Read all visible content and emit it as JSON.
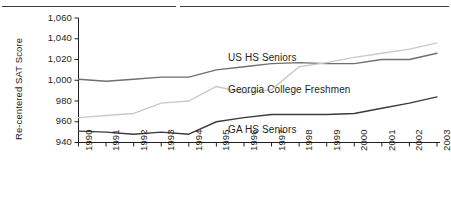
{
  "figure": {
    "caption_fragment": "",
    "ylabel": "Re-centered SAT Score"
  },
  "chart_data": {
    "type": "line",
    "title": "",
    "xlabel": "",
    "ylabel": "Re-centered SAT Score",
    "xlim": [
      1990,
      2003
    ],
    "ylim": [
      940,
      1060
    ],
    "yticks": [
      "940",
      "960",
      "980",
      "1,000",
      "1,020",
      "1,040",
      "1,060"
    ],
    "ytick_values": [
      940,
      960,
      980,
      1000,
      1020,
      1040,
      1060
    ],
    "grid": false,
    "legend": "inline-labels",
    "categories": [
      1990,
      1991,
      1992,
      1993,
      1994,
      1995,
      1996,
      1997,
      1998,
      1999,
      2000,
      2001,
      2002,
      2003
    ],
    "xtick_labels": [
      "1990",
      "1991",
      "1992",
      "1993",
      "1994",
      "1995",
      "1996",
      "1997",
      "1998",
      "1999",
      "2000",
      "2001",
      "2002",
      "2003"
    ],
    "series": [
      {
        "name": "US HS Seniors",
        "color": "#6f6f6f",
        "values": [
          1001,
          999,
          1001,
          1003,
          1003,
          1010,
          1013,
          1016,
          1017,
          1016,
          1016,
          1020,
          1020,
          1026
        ]
      },
      {
        "name": "Georgia College Freshmen",
        "color": "#c9c9c9",
        "values": [
          964,
          966,
          968,
          978,
          980,
          994,
          988,
          991,
          1013,
          1017,
          1022,
          1026,
          1030,
          1036
        ]
      },
      {
        "name": "GA HS Seniors",
        "color": "#3a3a3a",
        "values": [
          951,
          950,
          948,
          950,
          948,
          960,
          964,
          967,
          967,
          967,
          968,
          973,
          978,
          984
        ]
      }
    ]
  },
  "series_labels": [
    {
      "text": "US HS Seniors",
      "x": 228,
      "y": 52
    },
    {
      "text": "Georgia College Freshmen",
      "x": 228,
      "y": 84
    },
    {
      "text": "GA HS Seniors",
      "x": 228,
      "y": 124
    }
  ]
}
